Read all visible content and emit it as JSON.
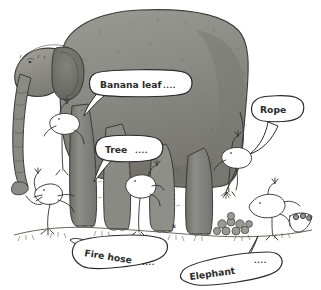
{
  "artwork": {
    "title": "Blind men and the elephant cartoon",
    "medium": "pen-and-ink line drawing with grey wash",
    "background_color": "#ffffff",
    "ink_color": "#2b2b2b",
    "elephant_body_color": "#8d8d88",
    "elephant_shadow_color": "#6f6f6a",
    "elephant_highlight_color": "#b4b4ae",
    "ground_color": "#7a7a75"
  },
  "subject": {
    "label": "elephant",
    "figures_label": "blindfolded figure"
  },
  "ground_mark": {
    "label": "x"
  },
  "speech_bubbles": [
    {
      "name": "banana-leaf",
      "text": "Banana leaf",
      "trailing": "....",
      "speaker": "figure-at-ear"
    },
    {
      "name": "tree",
      "text": "Tree",
      "trailing": "....",
      "speaker": "figure-at-leg"
    },
    {
      "name": "rope",
      "text": "Rope",
      "trailing": "",
      "speaker": "figure-at-tail"
    },
    {
      "name": "fire-hose",
      "text": "Fire hose",
      "trailing": "....",
      "speaker": "figure-at-trunk"
    },
    {
      "name": "elephant",
      "text": "Elephant",
      "trailing": "....",
      "speaker": "figure-at-dung"
    }
  ]
}
